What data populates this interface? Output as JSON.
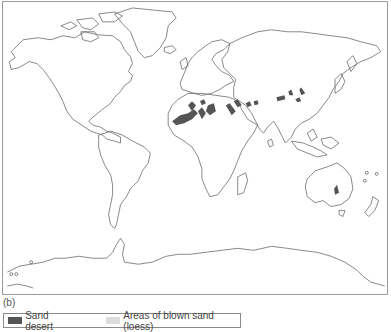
{
  "figure": {
    "panel_label": "(b)"
  },
  "legend": {
    "items": [
      {
        "label": "Sand desert",
        "color": "#555555"
      },
      {
        "label": "Areas of blown sand (loess)",
        "color": "#dddddd"
      }
    ]
  },
  "map": {
    "outline_color": "#6a6a6a",
    "frame_color": "#9a9a9a",
    "sand_desert_regions": [
      "Sahara (North Africa)",
      "Arabian Peninsula",
      "Iran / Central Asia",
      "Taklamakan / Gobi (Central Asia)",
      "Central Australia"
    ]
  }
}
